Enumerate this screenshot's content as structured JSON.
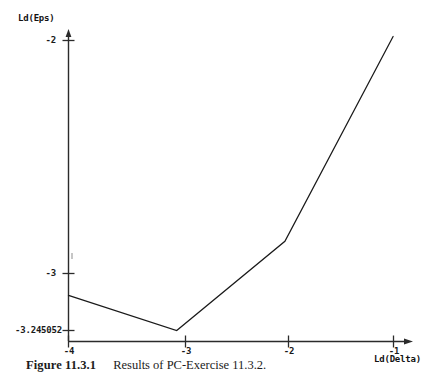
{
  "figure": {
    "caption_label": "Figure 11.3.1",
    "caption_text": "Results of PC-Exercise 11.3.2."
  },
  "chart_data": {
    "type": "line",
    "title": "",
    "xlabel": "Ld(Delta)",
    "ylabel": "Ld(Eps)",
    "x": [
      -4,
      -3,
      -2,
      -1
    ],
    "values": [
      -3.094,
      -3.245052,
      -2.862,
      -1.983
    ],
    "series": [
      {
        "name": "Ld(Eps) vs Ld(Delta)",
        "values": [
          -3.094,
          -3.245052,
          -2.862,
          -1.983
        ]
      }
    ],
    "xlim": [
      -4.0,
      -0.82
    ],
    "ylim": [
      -3.333,
      -1.92
    ],
    "xticks": [
      -4,
      -3,
      -2,
      -1
    ],
    "xtick_labels": [
      "-4",
      "-3",
      "-2",
      "-1"
    ],
    "yticks": [
      -2,
      -3,
      -3.245052
    ],
    "ytick_labels": [
      "-2",
      "-3",
      "-3.245052"
    ],
    "grid": false,
    "legend": "none",
    "line_color": "#1a1a1a",
    "axis_color": "#2b2b2b"
  }
}
